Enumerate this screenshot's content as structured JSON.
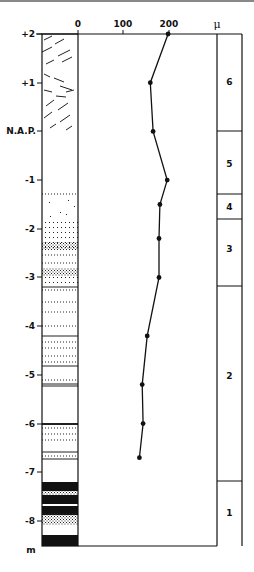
{
  "chart_data": {
    "type": "line",
    "title": "",
    "xlabel": "μ",
    "ylabel": "m",
    "x_ticks": [
      "0",
      "100",
      "200"
    ],
    "x_unit": "μ",
    "xlim": [
      0,
      300
    ],
    "y_ticks": [
      "+2",
      "+1",
      "N.A.P.",
      "-1",
      "-2",
      "-3",
      "-4",
      "-5",
      "-6",
      "-7",
      "-8"
    ],
    "y_unit": "m",
    "ylim": [
      -8.7,
      2
    ],
    "grid": false,
    "series": [
      {
        "name": "median grain size",
        "depth_m": [
          2.0,
          1.0,
          0.0,
          -1.0,
          -1.5,
          -2.2,
          -3.0,
          -4.2,
          -5.2,
          -6.0,
          -6.7
        ],
        "values": [
          198,
          159,
          165,
          196,
          180,
          178,
          178,
          152,
          141,
          143,
          135
        ]
      }
    ],
    "units": [
      {
        "label": "6",
        "top_m": 2.0,
        "bottom_m": 0.0
      },
      {
        "label": "5",
        "top_m": 0.0,
        "bottom_m": -1.3
      },
      {
        "label": "4",
        "top_m": -1.3,
        "bottom_m": -1.8
      },
      {
        "label": "3",
        "top_m": -1.8,
        "bottom_m": -3.2
      },
      {
        "label": "2",
        "top_m": -3.2,
        "bottom_m": -7.2
      },
      {
        "label": "1",
        "top_m": -7.2,
        "bottom_m": -8.5
      }
    ]
  },
  "labels": {
    "x0": "0",
    "x100": "100",
    "x200": "200",
    "mu": "μ",
    "y_plus2": "+2",
    "y_plus1": "+1",
    "y_nap": "N.A.P.",
    "y_m1": "-1",
    "y_m2": "-2",
    "y_m3": "-3",
    "y_m4": "-4",
    "y_m5": "-5",
    "y_m6": "-6",
    "y_m7": "-7",
    "y_m8": "-8",
    "y_unit": "m",
    "u6": "6",
    "u5": "5",
    "u4": "4",
    "u3": "3",
    "u2": "2",
    "u1": "1"
  }
}
